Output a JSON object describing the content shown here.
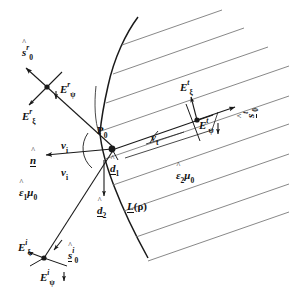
{
  "figure": {
    "type": "physics-ray-diagram",
    "width": 290,
    "height": 293,
    "stroke_color": "#1a1a1a",
    "background_color": "#ffffff"
  },
  "labels": {
    "s0_reflected": {
      "base": "s",
      "hat": "^",
      "sup": "r",
      "sub": "0",
      "text": "s0^r"
    },
    "E_psi_reflected": {
      "base": "E",
      "sup": "r",
      "sub": "ψ",
      "text": "E_psi^r"
    },
    "E_xi_reflected": {
      "base": "E",
      "sup": "r",
      "sub": "ξ",
      "text": "E_xi^r"
    },
    "n_hat": {
      "base": "n",
      "hat": "^",
      "text": "n-hat"
    },
    "nu_i_upper": {
      "base": "ν",
      "sub": "i",
      "text": "nu_i"
    },
    "nu_i_lower": {
      "base": "ν",
      "sub": "i",
      "text": "nu_i"
    },
    "nu_t": {
      "base": "ν",
      "sub": "t",
      "text": "nu_t"
    },
    "eps1_mu0": {
      "base": "ε",
      "hat": "^",
      "sub": "1",
      "mu": "μ",
      "musub": "0",
      "text": "eps1-hat mu0"
    },
    "eps2_mu0": {
      "base": "ε",
      "hat": "^",
      "sub": "2",
      "mu": "μ",
      "musub": "0",
      "text": "eps2-hat mu0"
    },
    "P0": {
      "base": "P",
      "sub": "0",
      "text": "P0"
    },
    "d1_hat": {
      "base": "d",
      "hat": "^",
      "sub": "1",
      "text": "d1-hat"
    },
    "d2_hat": {
      "base": "d",
      "hat": "^",
      "sub": "2",
      "text": "d2-hat"
    },
    "L_rho": {
      "base": "L",
      "arg": "(ρ)",
      "text": "L(rho)"
    },
    "E_xi_transmitted": {
      "base": "E",
      "sup": "t",
      "sub": "ξ",
      "text": "E_xi^t"
    },
    "E_psi_transmitted": {
      "base": "E",
      "sup": "t",
      "sub": "ψ",
      "text": "E_psi^t"
    },
    "s0_transmitted": {
      "base": "s",
      "hat": "^",
      "sup": "t",
      "sub": "0",
      "text": "s0^t"
    },
    "E_xi_incident": {
      "base": "E",
      "sup": "i",
      "sub": "ξ",
      "text": "E_xi^i"
    },
    "E_psi_incident": {
      "base": "E",
      "sup": "i",
      "sub": "ψ",
      "text": "E_psi^i"
    },
    "s0_incident": {
      "base": "s",
      "hat": "^",
      "sup": "i",
      "sub": "0",
      "text": "s0^i"
    }
  },
  "glyphs": {
    "hat": "ˆ",
    "psi": "ψ",
    "xi": "ξ",
    "nu": "ν",
    "eps": "ε",
    "mu": "μ",
    "rho": "ρ",
    "E": "E",
    "s": "s",
    "n": "n",
    "d": "d",
    "P": "P",
    "L": "L",
    "zero": "0",
    "one": "1",
    "two": "2",
    "i": "i",
    "r": "r",
    "t": "t",
    "paren_rho": "(ρ)"
  }
}
